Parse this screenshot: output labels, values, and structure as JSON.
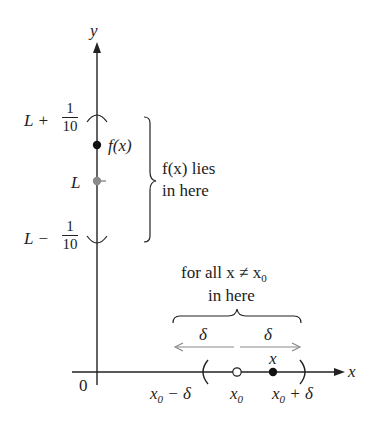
{
  "axes": {
    "x_label": "x",
    "y_label": "y",
    "origin_label": "0"
  },
  "y_axis_labels": {
    "upper": {
      "prefix": "L + ",
      "num": "1",
      "den": "10"
    },
    "middle": "L",
    "lower": {
      "prefix": "L − ",
      "num": "1",
      "den": "10"
    }
  },
  "points": {
    "fx_label": "f(x)",
    "x_label": "x"
  },
  "right_annotation": {
    "line1": "f(x) lies",
    "line2": "in here"
  },
  "top_annotation": {
    "line1": "for all x ≠ x",
    "line1_sub": "0",
    "line2": "in here"
  },
  "delta_labels": {
    "left": "δ",
    "right": "δ"
  },
  "x_axis_labels": {
    "left": "x",
    "left_sub": "0",
    "left_suffix": " − δ",
    "center": "x",
    "center_sub": "0",
    "right": "x",
    "right_sub": "0",
    "right_suffix": " + δ"
  },
  "colors": {
    "axis": "#222222",
    "gray": "#8a8a8a",
    "point": "#111111"
  }
}
